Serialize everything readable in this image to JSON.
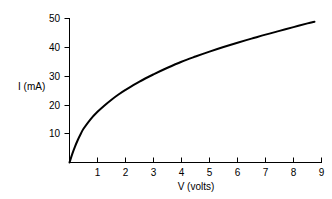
{
  "chart_data": {
    "type": "line",
    "title": "",
    "subtitle": "",
    "xlabel": "V (volts)",
    "ylabel": "I (mA)",
    "xlim": [
      0,
      9
    ],
    "ylim": [
      0,
      50
    ],
    "xticks": [
      1,
      2,
      3,
      4,
      5,
      6,
      7,
      8,
      9
    ],
    "yticks": [
      10,
      20,
      30,
      40,
      50
    ],
    "xtick_labels": [
      "1",
      "2",
      "3",
      "4",
      "5",
      "6",
      "7",
      "8",
      "9"
    ],
    "ytick_labels": [
      "10",
      "20",
      "30",
      "40",
      "50"
    ],
    "grid": false,
    "legend": false,
    "legend_position": "none",
    "annotations": [],
    "series": [
      {
        "name": "I vs V",
        "color": "#000000",
        "x": [
          0.0,
          0.1,
          0.2,
          0.3,
          0.4,
          0.5,
          0.75,
          1.0,
          1.25,
          1.5,
          1.75,
          2.0,
          2.5,
          3.0,
          3.5,
          4.0,
          4.5,
          5.0,
          5.5,
          6.0,
          6.5,
          7.0,
          7.5,
          8.0,
          8.5,
          8.75
        ],
        "y": [
          0.0,
          3.0,
          5.6,
          7.9,
          9.9,
          11.7,
          15.0,
          17.6,
          19.8,
          21.8,
          23.6,
          25.2,
          28.1,
          30.6,
          32.9,
          35.0,
          36.8,
          38.5,
          40.1,
          41.6,
          43.0,
          44.4,
          45.7,
          47.0,
          48.3,
          48.9
        ]
      }
    ]
  },
  "figure": {
    "background_color": "#ffffff",
    "foreground_color": "#000000"
  }
}
